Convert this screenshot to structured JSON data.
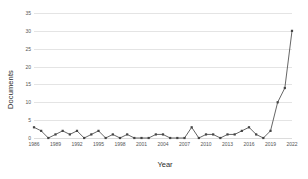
{
  "chart_data": {
    "type": "line",
    "title": "",
    "xlabel": "Year",
    "ylabel": "Documents",
    "xlim": [
      1986,
      2022
    ],
    "ylim": [
      0,
      35
    ],
    "grid": true,
    "legend": false,
    "ytick_labels": [
      "35",
      "30",
      "25",
      "20",
      "15",
      "10",
      "5",
      "0"
    ],
    "ytick_values": [
      35,
      30,
      25,
      20,
      15,
      10,
      5,
      0
    ],
    "xtick_labels": [
      "1986",
      "1989",
      "1992",
      "1995",
      "1998",
      "2001",
      "2004",
      "2007",
      "2010",
      "2013",
      "2016",
      "2019",
      "2022"
    ],
    "xtick_values": [
      1986,
      1989,
      1992,
      1995,
      1998,
      2001,
      2004,
      2007,
      2010,
      2013,
      2016,
      2019,
      2022
    ],
    "marker": "square",
    "line_color": "#555555",
    "marker_color": "#444444",
    "grid_color": "#e4e4e4",
    "x": [
      1986,
      1987,
      1988,
      1989,
      1990,
      1991,
      1992,
      1993,
      1994,
      1995,
      1996,
      1997,
      1998,
      1999,
      2000,
      2001,
      2002,
      2003,
      2004,
      2005,
      2006,
      2007,
      2008,
      2009,
      2010,
      2011,
      2012,
      2013,
      2014,
      2015,
      2016,
      2017,
      2018,
      2019,
      2020,
      2021,
      2022
    ],
    "values": [
      3,
      2,
      0,
      1,
      2,
      1,
      2,
      0,
      1,
      2,
      0,
      1,
      0,
      1,
      0,
      0,
      0,
      1,
      1,
      0,
      0,
      0,
      3,
      0,
      1,
      1,
      0,
      1,
      1,
      2,
      3,
      1,
      0,
      2,
      10,
      14,
      30
    ],
    "series": [
      {
        "name": "Documents",
        "values": [
          3,
          2,
          0,
          1,
          2,
          1,
          2,
          0,
          1,
          2,
          0,
          1,
          0,
          1,
          0,
          0,
          0,
          1,
          1,
          0,
          0,
          0,
          3,
          0,
          1,
          1,
          0,
          1,
          1,
          2,
          3,
          1,
          0,
          2,
          10,
          14,
          30
        ]
      }
    ]
  }
}
